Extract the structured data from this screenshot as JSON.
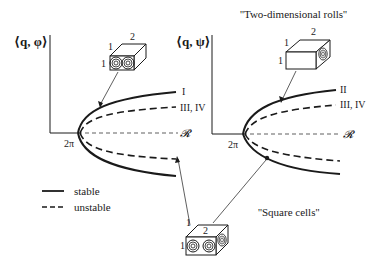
{
  "titles": {
    "rolls": "''Two-dimensional rolls''",
    "squares": "''Square cells''"
  },
  "panels": [
    {
      "y_label": "⟨q, φ⟩",
      "x_label": "𝓡",
      "bif_label": "2π",
      "branch_labels": [
        "I",
        "III, IV"
      ],
      "box_labels": {
        "top": "2",
        "side_top": "1",
        "side_left": "1"
      }
    },
    {
      "y_label": "⟨q, ψ⟩",
      "x_label": "𝓡",
      "bif_label": "2π",
      "branch_labels": [
        "II",
        "III, IV"
      ],
      "box_labels": {
        "top": "2",
        "side_top": "1",
        "side_left": "1"
      }
    }
  ],
  "square_box": {
    "top": "2",
    "side_top": "1",
    "side_left": "1"
  },
  "legend": {
    "stable": "stable",
    "unstable": "unstable"
  },
  "colors": {
    "ink": "#1a1a1a",
    "background": "#ffffff"
  }
}
